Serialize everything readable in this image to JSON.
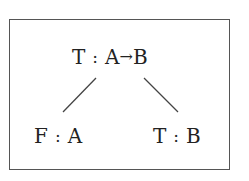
{
  "diagram": {
    "type": "proof-tree",
    "root": {
      "truth": "T",
      "separator": ":",
      "formula_left": "A",
      "connective": "→",
      "formula_right": "B"
    },
    "children": [
      {
        "truth": "F",
        "separator": ":",
        "formula": "A"
      },
      {
        "truth": "T",
        "separator": ":",
        "formula": "B"
      }
    ],
    "edges": [
      {
        "from": "root",
        "to": "children.0"
      },
      {
        "from": "root",
        "to": "children.1"
      }
    ],
    "colors": {
      "text": "#222222",
      "border": "#555555",
      "edge": "#444444",
      "background": "#ffffff"
    }
  }
}
